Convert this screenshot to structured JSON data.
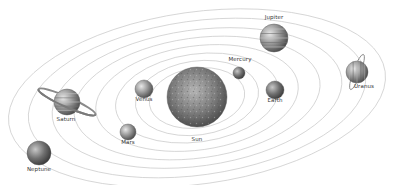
{
  "diagram": {
    "type": "solar-system",
    "background": "#ffffff",
    "orbit_color": "#c8c8c8",
    "center": {
      "x": 197,
      "y": 98
    }
  },
  "bodies": [
    {
      "name": "Sun",
      "label": "Sun",
      "x": 197,
      "y": 97,
      "r": 30,
      "color": "#8a8a8a",
      "label_x": 197,
      "label_y": 140
    },
    {
      "name": "Mercury",
      "label": "Mercury",
      "x": 239,
      "y": 73,
      "r": 6,
      "color": "#8c8c8c",
      "label_x": 240,
      "label_y": 60
    },
    {
      "name": "Venus",
      "label": "Venus",
      "x": 144,
      "y": 89,
      "r": 9,
      "color": "#a8a8a8",
      "label_x": 144,
      "label_y": 100
    },
    {
      "name": "Earth",
      "label": "Earth",
      "x": 275,
      "y": 90,
      "r": 9,
      "color": "#6e6e6e",
      "label_x": 275,
      "label_y": 101
    },
    {
      "name": "Mars",
      "label": "Mars",
      "x": 128,
      "y": 132,
      "r": 8,
      "color": "#8e8e8e",
      "label_x": 128,
      "label_y": 143
    },
    {
      "name": "Jupiter",
      "label": "Jupiter",
      "x": 274,
      "y": 38,
      "r": 14,
      "color": "#999999",
      "label_x": 274,
      "label_y": 18
    },
    {
      "name": "Saturn",
      "label": "Saturn",
      "x": 67,
      "y": 102,
      "r": 13,
      "color": "#9a9a9a",
      "label_x": 66,
      "label_y": 120,
      "ring": true
    },
    {
      "name": "Uranus",
      "label": "Uranus",
      "x": 357,
      "y": 72,
      "r": 11,
      "color": "#8a8a8a",
      "label_x": 364,
      "label_y": 87,
      "ring": true
    },
    {
      "name": "Neptune",
      "label": "Neptune",
      "x": 39,
      "y": 153,
      "r": 12,
      "color": "#777777",
      "label_x": 39,
      "label_y": 170
    }
  ],
  "orbits": [
    {
      "rx": 48,
      "ry": 30
    },
    {
      "rx": 62,
      "ry": 37
    },
    {
      "rx": 82,
      "ry": 44
    },
    {
      "rx": 102,
      "ry": 52
    },
    {
      "rx": 124,
      "ry": 60
    },
    {
      "rx": 146,
      "ry": 68
    },
    {
      "rx": 170,
      "ry": 77
    },
    {
      "rx": 190,
      "ry": 86
    }
  ]
}
